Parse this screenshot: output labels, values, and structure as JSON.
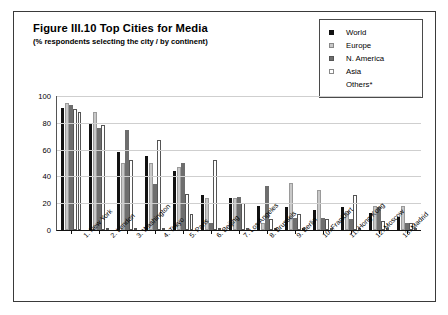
{
  "figure": {
    "title": "Figure III.10  Top Cities for Media",
    "subtitle": "(% respondents selecting the city / by continent)"
  },
  "legend": {
    "position": "top-right",
    "items": [
      {
        "label": "World",
        "color": "#111111",
        "swatch": "filled-square"
      },
      {
        "label": "Europe",
        "color": "#c8c8c8",
        "swatch": "light-square"
      },
      {
        "label": "N. America",
        "color": "#6e6e6e",
        "swatch": "dark-gray-square"
      },
      {
        "label": "Asia",
        "color": "#ffffff",
        "swatch": "open-square"
      },
      {
        "label": "Others*",
        "color": "#ffffff",
        "swatch": "none"
      }
    ]
  },
  "chart_data": {
    "type": "bar",
    "title": "Figure III.10  Top Cities for Media",
    "subtitle": "(% respondents selecting the city / by continent)",
    "xlabel": "",
    "ylabel": "",
    "ylim": [
      0,
      100
    ],
    "yticks": [
      0,
      20,
      40,
      60,
      80,
      100
    ],
    "grid": true,
    "legend_position": "top-right",
    "categories": [
      "1. New York",
      "2. London",
      "3. Washington",
      "4. Tokyo",
      "5. Paris",
      "6. Beijing",
      "7. Los Angeles",
      "8. Brussels",
      "9. Berlin",
      "10. Frankfurt",
      "11. Hong Kong",
      "12. Moscow",
      "13. Madrid"
    ],
    "series": [
      {
        "name": "World",
        "color": "#111111",
        "values": [
          91,
          80,
          58,
          55,
          44,
          26,
          24,
          18,
          17,
          15,
          17,
          13,
          10
        ]
      },
      {
        "name": "Europe",
        "color": "#c8c8c8",
        "values": [
          95,
          88,
          50,
          50,
          47,
          24,
          24,
          5,
          35,
          30,
          14,
          18,
          18
        ]
      },
      {
        "name": "N. America",
        "color": "#6e6e6e",
        "values": [
          93,
          76,
          75,
          34,
          50,
          5,
          25,
          33,
          9,
          9,
          8,
          17,
          5
        ]
      },
      {
        "name": "Asia",
        "color": "#ffffff",
        "values": [
          90,
          78,
          52,
          67,
          27,
          52,
          20,
          8,
          12,
          8,
          26,
          7,
          5
        ]
      },
      {
        "name": "Others*",
        "color": "#fdfdfd",
        "values": [
          88,
          0,
          0,
          0,
          12,
          0,
          0,
          0,
          0,
          0,
          0,
          0,
          0
        ]
      }
    ]
  }
}
